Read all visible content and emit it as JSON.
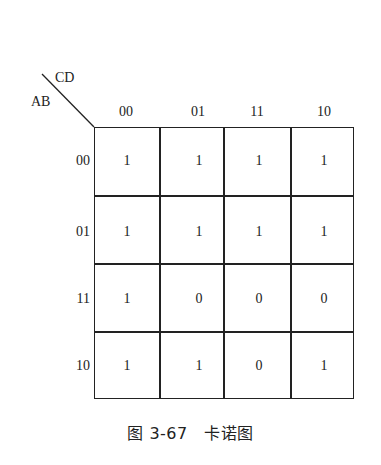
{
  "figure": {
    "corner": {
      "col_var": "CD",
      "row_var": "AB"
    },
    "col_labels": [
      "00",
      "01",
      "11",
      "10"
    ],
    "row_labels": [
      "00",
      "01",
      "11",
      "10"
    ],
    "cells": [
      [
        "1",
        "1",
        "1",
        "1"
      ],
      [
        "1",
        "1",
        "1",
        "1"
      ],
      [
        "1",
        "0",
        "0",
        "0"
      ],
      [
        "1",
        "1",
        "0",
        "1"
      ]
    ],
    "caption": "图 3-67　卡诺图"
  }
}
